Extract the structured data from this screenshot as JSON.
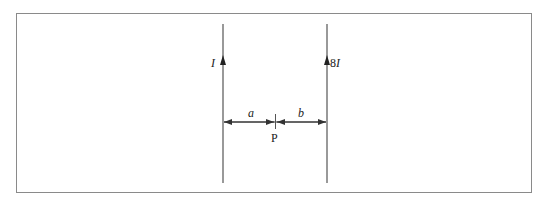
{
  "diagram": {
    "wires": [
      {
        "id": "left",
        "current_label": "I",
        "direction": "up"
      },
      {
        "id": "right",
        "current_label": "8I",
        "current_prefix": "8",
        "current_symbol": "I",
        "direction": "up"
      }
    ],
    "dimensions": [
      {
        "label": "a",
        "from": "left-wire",
        "to": "P"
      },
      {
        "label": "b",
        "from": "P",
        "to": "right-wire"
      }
    ],
    "point": {
      "label": "P"
    },
    "colors": {
      "line": "#555555",
      "frame": "#8a8a8a",
      "text": "#222222"
    }
  }
}
